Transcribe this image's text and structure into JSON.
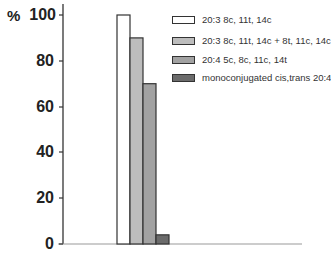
{
  "chart_data": {
    "type": "bar",
    "title": "",
    "xlabel": "",
    "ylabel": "%",
    "ylim": [
      0,
      100
    ],
    "yticks": [
      0,
      20,
      40,
      60,
      80,
      100
    ],
    "grid": false,
    "legend_position": "upper right",
    "categories": [
      ""
    ],
    "series": [
      {
        "name": "20:3 8c, 11t, 14c",
        "values": [
          100
        ],
        "color": "#ffffff"
      },
      {
        "name": "20:3 8c, 11t, 14c + 8t, 11c, 14c",
        "values": [
          90
        ],
        "color": "#bdbdbd"
      },
      {
        "name": "20:4 5c, 8c, 11c, 14t",
        "values": [
          70
        ],
        "color": "#a2a2a2"
      },
      {
        "name": "monoconjugated cis,trans 20:4",
        "values": [
          4
        ],
        "color": "#6b6b6b"
      }
    ]
  },
  "axis": {
    "y_unit": "%",
    "tick_labels": [
      "100",
      "80",
      "60",
      "40",
      "20",
      "0"
    ]
  },
  "legend": {
    "items": [
      {
        "label": "20:3 8c, 11t, 14c",
        "color": "#ffffff"
      },
      {
        "label": "20:3 8c, 11t, 14c + 8t, 11c, 14c",
        "color": "#bdbdbd"
      },
      {
        "label": "20:4 5c, 8c, 11c, 14t",
        "color": "#a2a2a2"
      },
      {
        "label": "monoconjugated cis,trans 20:4",
        "color": "#6b6b6b"
      }
    ]
  }
}
